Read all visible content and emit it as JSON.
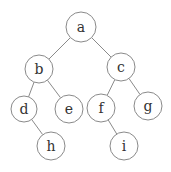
{
  "diagram": {
    "type": "binary-tree",
    "nodes": [
      {
        "id": "a",
        "label": "a",
        "x": 81,
        "y": 27,
        "r": 15
      },
      {
        "id": "b",
        "label": "b",
        "x": 39,
        "y": 69,
        "r": 14
      },
      {
        "id": "c",
        "label": "c",
        "x": 121,
        "y": 67,
        "r": 14
      },
      {
        "id": "d",
        "label": "d",
        "x": 24,
        "y": 109,
        "r": 13
      },
      {
        "id": "e",
        "label": "e",
        "x": 69,
        "y": 109,
        "r": 14
      },
      {
        "id": "f",
        "label": "f",
        "x": 101,
        "y": 108,
        "r": 14
      },
      {
        "id": "g",
        "label": "g",
        "x": 148,
        "y": 106,
        "r": 14
      },
      {
        "id": "h",
        "label": "h",
        "x": 51,
        "y": 146,
        "r": 14
      },
      {
        "id": "i",
        "label": "i",
        "x": 124,
        "y": 146,
        "r": 14
      }
    ],
    "edges": [
      {
        "from": "a",
        "to": "b"
      },
      {
        "from": "a",
        "to": "c"
      },
      {
        "from": "b",
        "to": "d"
      },
      {
        "from": "b",
        "to": "e"
      },
      {
        "from": "c",
        "to": "f"
      },
      {
        "from": "c",
        "to": "g"
      },
      {
        "from": "d",
        "to": "h"
      },
      {
        "from": "f",
        "to": "i"
      }
    ]
  }
}
